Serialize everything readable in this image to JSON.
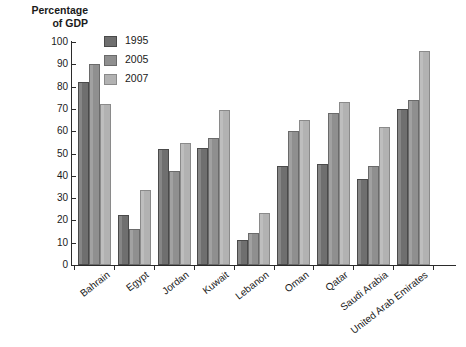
{
  "chart_data": {
    "type": "bar",
    "title": "",
    "xlabel": "",
    "ylabel": "Percentage\nof GDP",
    "ylim": [
      0,
      100
    ],
    "yticks": [
      0,
      10,
      20,
      30,
      40,
      50,
      60,
      70,
      80,
      90,
      100
    ],
    "grid": false,
    "legend_position": "top-left-inside",
    "categories": [
      "Bahrain",
      "Egypt",
      "Jordan",
      "Kuwait",
      "Lebanon",
      "Oman",
      "Qatar",
      "Saudi Arabia",
      "United Arab Emirates"
    ],
    "series": [
      {
        "name": "1995",
        "color": "#6f6f6f",
        "values": [
          82,
          22.5,
          52,
          52.5,
          11,
          44.5,
          45.5,
          38.5,
          70
        ]
      },
      {
        "name": "2005",
        "color": "#8f8f8f",
        "values": [
          90,
          16,
          42,
          57,
          14.5,
          60,
          68,
          44.5,
          74
        ]
      },
      {
        "name": "2007",
        "color": "#b2b2b2",
        "values": [
          72,
          33.5,
          54.5,
          69.5,
          23.5,
          65,
          73,
          62,
          96
        ]
      }
    ]
  }
}
